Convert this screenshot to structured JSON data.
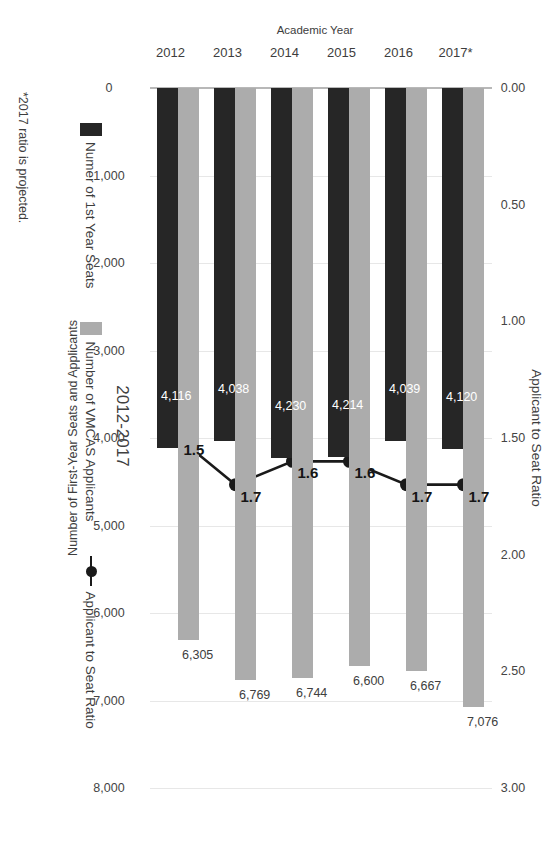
{
  "chart_data": {
    "type": "bar",
    "title": "2012-2017",
    "categories": [
      "2012",
      "2013",
      "2014",
      "2015",
      "2016",
      "2017*"
    ],
    "series": [
      {
        "name": "Numer of 1st Year Seats",
        "axis": "primary",
        "color": "#262626",
        "values": [
          4116,
          4038,
          4230,
          4214,
          4039,
          4120
        ],
        "labels": [
          "4,116",
          "4,038",
          "4,230",
          "4,214",
          "4,039",
          "4,120"
        ]
      },
      {
        "name": "Number of VMCAS Applicants",
        "axis": "primary",
        "color": "#acacac",
        "values": [
          6305,
          6769,
          6744,
          6600,
          6667,
          7076
        ],
        "labels": [
          "6,305",
          "6,769",
          "6,744",
          "6,600",
          "6,667",
          "7,076"
        ]
      },
      {
        "name": "Applicant to Seat Ratio",
        "axis": "secondary",
        "type": "line",
        "color": "#1a1a1a",
        "values": [
          1.5,
          1.7,
          1.6,
          1.6,
          1.7,
          1.7
        ],
        "labels": [
          "1.5",
          "1.7",
          "1.6",
          "1.6",
          "1.7",
          "1.7"
        ]
      }
    ],
    "xlabel": "Academic Year",
    "ylabel": "Number of First-Year Seats and Applicants",
    "ylabel_secondary": "Applicant to Seat Ratio",
    "ylim": [
      0,
      8000
    ],
    "yticks": [
      0,
      1000,
      2000,
      3000,
      4000,
      5000,
      6000,
      7000,
      8000
    ],
    "ytick_labels": [
      "0",
      "1,000",
      "2,000",
      "3,000",
      "4,000",
      "5,000",
      "6,000",
      "7,000",
      "8,000"
    ],
    "ylim_secondary": [
      0,
      3.0
    ],
    "yticks_secondary": [
      0,
      0.5,
      1.0,
      1.5,
      2.0,
      2.5,
      3.0
    ],
    "ytick_labels_secondary": [
      "0.00",
      "0.50",
      "1.00",
      "1.50",
      "2.00",
      "2.50",
      "3.00"
    ],
    "grid": true,
    "legend_position": "top",
    "footnote": "*2017 ratio is projected.",
    "colors": {
      "seats_bar": "#262626",
      "applicants_bar": "#acacac",
      "ratio_line": "#1a1a1a",
      "gridline": "#e7e7e7",
      "axis_line": "#b8b8b8"
    }
  }
}
